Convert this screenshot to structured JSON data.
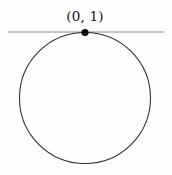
{
  "figure": {
    "type": "geometry-diagram",
    "background_color": "#fefefe",
    "width": 172,
    "height": 175
  },
  "labels": {
    "tangent_point": "(0, 1)"
  },
  "chart_data": {
    "type": "scatter",
    "title": "",
    "xlabel": "",
    "ylabel": "",
    "grid": false,
    "legend": null,
    "shapes": [
      {
        "kind": "line",
        "name": "tangent-line",
        "x1": 8,
        "y1": 32,
        "x2": 164,
        "y2": 32,
        "color": "#8a8a8a",
        "stroke_width": 1.1
      },
      {
        "kind": "circle",
        "name": "circle",
        "cx": 85,
        "cy": 98,
        "r": 65.5,
        "stroke": "#2f2f2f",
        "stroke_width": 1.05,
        "fill": "none"
      },
      {
        "kind": "point",
        "name": "tangency-point",
        "cx": 85,
        "cy": 32.5,
        "r": 3.6,
        "fill": "#0d0d0d",
        "label": "(0, 1)"
      }
    ],
    "annotations": [
      {
        "text": "(0, 1)",
        "x": 85,
        "y": 17,
        "anchor": "middle",
        "color": "#121212"
      }
    ]
  }
}
